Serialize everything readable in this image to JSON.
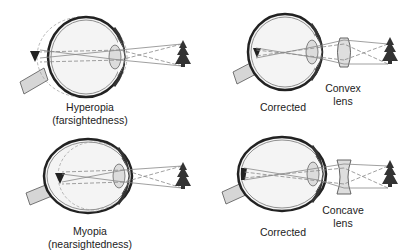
{
  "diagram": {
    "panels": [
      {
        "id": "hyperopia",
        "label_line1": "Hyperopia",
        "label_line2": "(farsightedness)",
        "focus": "behind retina"
      },
      {
        "id": "hyperopia-corrected",
        "label": "Corrected",
        "lens_label_line1": "Convex",
        "lens_label_line2": "lens",
        "lens_type": "convex"
      },
      {
        "id": "myopia",
        "label_line1": "Myopia",
        "label_line2": "(nearsightedness)",
        "focus": "in front of retina"
      },
      {
        "id": "myopia-corrected",
        "label": "Corrected",
        "lens_label_line1": "Concave",
        "lens_label_line2": "lens",
        "lens_type": "concave"
      }
    ],
    "colors": {
      "eye_outline": "#333333",
      "eye_fill": "#f2f2f2",
      "lens_fill": "#d9d9d9",
      "ray": "#888888",
      "tree": "#333333",
      "nerve": "#cfcfcf"
    },
    "icons": [
      "eye-cross-section",
      "tree-object",
      "inverted-image",
      "convex-lens",
      "concave-lens",
      "optic-nerve"
    ]
  }
}
